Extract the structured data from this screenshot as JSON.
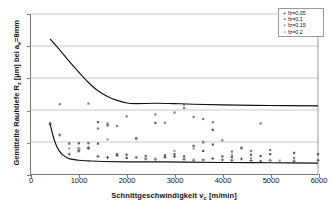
{
  "chart_data": {
    "type": "scatter",
    "title": "",
    "xlabel": "Schnittgeschwindigkeit vc [m/min]",
    "ylabel": "Gemittelte Rauhtiefe Rz [µm] bei ae=8mm",
    "xlim": [
      0,
      6000
    ],
    "ylim": [
      0,
      5
    ],
    "xticks": [
      "0",
      "1000",
      "2000",
      "3000",
      "4000",
      "5000",
      "6000"
    ],
    "xtick_values": [
      0,
      1000,
      2000,
      3000,
      4000,
      5000,
      6000
    ],
    "yticks": [
      "0",
      "1",
      "2",
      "3",
      "4",
      "5"
    ],
    "ytick_values": [
      0,
      1,
      2,
      3,
      4,
      5
    ],
    "grid": "horizontal",
    "legend_position": "top-right",
    "legend": [
      {
        "label": "fz=0,05",
        "marker": "+"
      },
      {
        "label": "fz=0,1",
        "marker": "▪"
      },
      {
        "label": "fz=0,15",
        "marker": "▪"
      },
      {
        "label": "fz=0,2",
        "marker": "▪"
      }
    ],
    "series": [
      {
        "name": "fz=0,05",
        "marker": "+",
        "color": "#3c3c3c",
        "points": [
          [
            400,
            1.56
          ],
          [
            600,
            1.22
          ],
          [
            800,
            0.62
          ],
          [
            1000,
            0.72
          ],
          [
            1000,
            0.8
          ],
          [
            1200,
            0.82
          ],
          [
            1400,
            0.55
          ],
          [
            1600,
            0.52
          ],
          [
            1800,
            0.58
          ],
          [
            2000,
            0.6
          ],
          [
            2200,
            0.52
          ],
          [
            2400,
            0.47
          ],
          [
            2600,
            0.46
          ],
          [
            2800,
            0.52
          ],
          [
            3000,
            0.55
          ],
          [
            3200,
            0.46
          ],
          [
            3400,
            0.43
          ],
          [
            3600,
            0.44
          ],
          [
            3800,
            0.48
          ],
          [
            4000,
            0.44
          ],
          [
            4200,
            0.43
          ],
          [
            4400,
            0.47
          ],
          [
            4600,
            0.42
          ],
          [
            4800,
            0.4
          ],
          [
            5000,
            0.42
          ],
          [
            5500,
            0.4
          ],
          [
            6000,
            0.43
          ]
        ]
      },
      {
        "name": "fz=0,1",
        "marker": "▪",
        "color": "#5a5a5a",
        "points": [
          [
            400,
            1.58
          ],
          [
            800,
            0.95
          ],
          [
            1000,
            0.96
          ],
          [
            1000,
            0.74
          ],
          [
            1200,
            0.96
          ],
          [
            1200,
            0.8
          ],
          [
            1400,
            1.62
          ],
          [
            1400,
            0.95
          ],
          [
            1600,
            1.52
          ],
          [
            1800,
            0.62
          ],
          [
            2000,
            0.5
          ],
          [
            2200,
            1.12
          ],
          [
            2400,
            0.56
          ],
          [
            2600,
            1.6
          ],
          [
            2800,
            0.58
          ],
          [
            3000,
            0.62
          ],
          [
            3200,
            0.55
          ],
          [
            3400,
            0.88
          ],
          [
            3600,
            1.0
          ],
          [
            3600,
            0.72
          ],
          [
            3800,
            1.38
          ],
          [
            3800,
            0.92
          ],
          [
            4000,
            0.55
          ],
          [
            4200,
            0.53
          ],
          [
            4400,
            0.82
          ],
          [
            4600,
            0.6
          ],
          [
            4800,
            0.56
          ],
          [
            5000,
            0.62
          ],
          [
            5500,
            0.66
          ],
          [
            6000,
            0.62
          ]
        ]
      },
      {
        "name": "fz=0,15",
        "marker": "▪",
        "color": "#7d7d7d",
        "points": [
          [
            600,
            2.18
          ],
          [
            1200,
            2.2
          ],
          [
            1400,
            1.42
          ],
          [
            1600,
            1.58
          ],
          [
            1800,
            1.5
          ],
          [
            2000,
            1.8
          ],
          [
            2200,
            1.1
          ],
          [
            2600,
            1.86
          ],
          [
            2800,
            1.6
          ],
          [
            3000,
            1.92
          ],
          [
            3200,
            2.06
          ],
          [
            3400,
            1.78
          ],
          [
            3600,
            1.72
          ],
          [
            3800,
            1.62
          ],
          [
            4000,
            1.05
          ],
          [
            4200,
            0.7
          ],
          [
            4400,
            0.8
          ],
          [
            4600,
            0.72
          ],
          [
            4800,
            1.58
          ],
          [
            5000,
            0.75
          ],
          [
            5500,
            0.5
          ]
        ]
      },
      {
        "name": "fz=0,2",
        "marker": "▪",
        "color": "#9e9e9e",
        "points": [
          [
            800,
            0.8
          ],
          [
            1000,
            0.78
          ],
          [
            1600,
            1.08
          ],
          [
            2400,
            0.52
          ],
          [
            2600,
            0.48
          ],
          [
            3000,
            0.72
          ],
          [
            3200,
            2.16
          ],
          [
            3400,
            0.8
          ],
          [
            3400,
            0.45
          ],
          [
            3600,
            0.98
          ],
          [
            4200,
            0.6
          ],
          [
            4600,
            0.5
          ],
          [
            5000,
            0.44
          ],
          [
            5200,
            0.42
          ]
        ]
      }
    ],
    "trend_curves": [
      {
        "name": "upper-trend-curve",
        "start": [
          400,
          4.22
        ],
        "plateau": 2.13,
        "points": [
          [
            400,
            4.22
          ],
          [
            600,
            3.88
          ],
          [
            800,
            3.52
          ],
          [
            1000,
            3.18
          ],
          [
            1200,
            2.86
          ],
          [
            1400,
            2.6
          ],
          [
            1600,
            2.42
          ],
          [
            1800,
            2.3
          ],
          [
            2000,
            2.22
          ],
          [
            2200,
            2.2
          ],
          [
            2600,
            2.21
          ],
          [
            3000,
            2.2
          ],
          [
            3400,
            2.18
          ],
          [
            4000,
            2.16
          ],
          [
            5000,
            2.14
          ],
          [
            6000,
            2.13
          ]
        ]
      },
      {
        "name": "lower-trend-curve",
        "start": [
          400,
          1.55
        ],
        "plateau": 0.34,
        "points": [
          [
            400,
            1.55
          ],
          [
            500,
            1.0
          ],
          [
            600,
            0.7
          ],
          [
            700,
            0.56
          ],
          [
            800,
            0.48
          ],
          [
            1000,
            0.43
          ],
          [
            1200,
            0.41
          ],
          [
            1500,
            0.39
          ],
          [
            2000,
            0.38
          ],
          [
            2600,
            0.38
          ],
          [
            3200,
            0.37
          ],
          [
            4000,
            0.36
          ],
          [
            5000,
            0.35
          ],
          [
            6000,
            0.34
          ]
        ]
      }
    ]
  }
}
